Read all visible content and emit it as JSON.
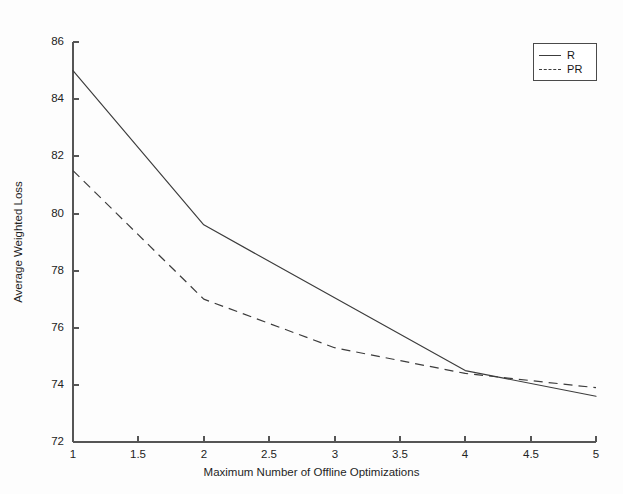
{
  "chart_data": {
    "type": "line",
    "title": "",
    "xlabel": "Maximum Number of Offline Optimizations",
    "ylabel": "Average Weighted Loss",
    "xlim": [
      1,
      5
    ],
    "ylim": [
      72,
      86
    ],
    "xticks": [
      "1",
      "1.5",
      "2",
      "2.5",
      "3",
      "3.5",
      "4",
      "4.5",
      "5"
    ],
    "xtick_values": [
      1,
      1.5,
      2,
      2.5,
      3,
      3.5,
      4,
      4.5,
      5
    ],
    "yticks": [
      "72",
      "74",
      "76",
      "78",
      "80",
      "82",
      "84",
      "86"
    ],
    "ytick_values": [
      72,
      74,
      76,
      78,
      80,
      82,
      84,
      86
    ],
    "grid": false,
    "legend_position": "top-right",
    "series": [
      {
        "name": "R",
        "style": "solid",
        "color": "#3c3c3c",
        "x": [
          1,
          2,
          4,
          5
        ],
        "values": [
          85.0,
          79.6,
          74.5,
          73.6
        ]
      },
      {
        "name": "PR",
        "style": "dashed",
        "color": "#3c3c3c",
        "x": [
          1,
          2,
          3,
          4,
          5
        ],
        "values": [
          81.5,
          77.0,
          75.3,
          74.4,
          73.9
        ]
      }
    ]
  },
  "legend": {
    "entries": [
      {
        "label": "R",
        "style": "solid"
      },
      {
        "label": "PR",
        "style": "dashed"
      }
    ]
  },
  "colors": {
    "background": "#ffffff",
    "axis": "#4a4a4a",
    "line": "#3c3c3c",
    "text": "#1f1f1f"
  },
  "caption_fragment": ""
}
